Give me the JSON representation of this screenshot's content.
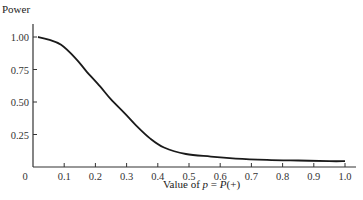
{
  "chart_data": {
    "type": "line",
    "title": "",
    "xlabel": "Value of p = P(+)",
    "xlabel_parts": {
      "prefix": "Value of ",
      "var": "p",
      "mid": " = ",
      "func": "P",
      "suffix": "(+)"
    },
    "ylabel": "Power",
    "xlim": [
      0,
      1.0
    ],
    "ylim": [
      0,
      1.0
    ],
    "grid": false,
    "legend": null,
    "x_ticks": [
      "0",
      "0.1",
      "0.2",
      "0.3",
      "0.4",
      "0.5",
      "0.6",
      "0.7",
      "0.8",
      "0.9",
      "1.0"
    ],
    "y_ticks": [
      "0.25",
      "0.50",
      "0.75",
      "1.00"
    ],
    "series": [
      {
        "name": "Power",
        "color": "#1a1a1a",
        "x": [
          0.016,
          0.05,
          0.09,
          0.135,
          0.17,
          0.215,
          0.25,
          0.295,
          0.33,
          0.375,
          0.42,
          0.49,
          0.57,
          0.65,
          0.75,
          0.85,
          0.95,
          1.0
        ],
        "y": [
          1.0,
          0.98,
          0.94,
          0.84,
          0.74,
          0.62,
          0.52,
          0.41,
          0.32,
          0.22,
          0.15,
          0.1,
          0.08,
          0.065,
          0.055,
          0.05,
          0.045,
          0.045
        ]
      }
    ]
  }
}
